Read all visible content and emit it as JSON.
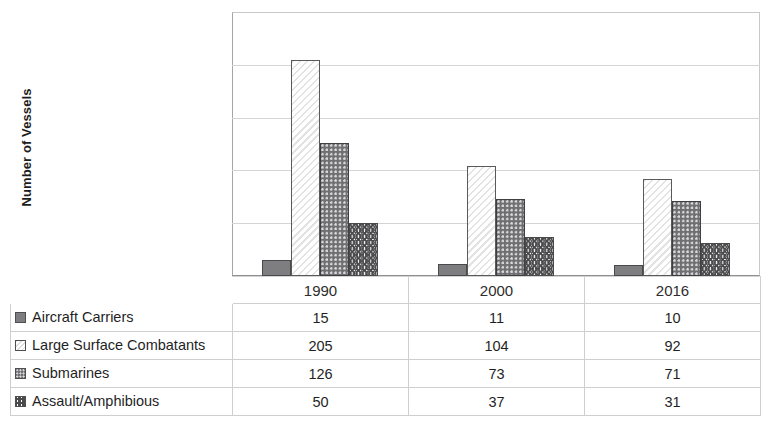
{
  "chart_data": {
    "type": "bar",
    "title": "",
    "xlabel": "",
    "ylabel": "Number of Vessels",
    "ylim": [
      0,
      250
    ],
    "yticks": [
      250,
      200,
      150,
      100,
      50,
      0
    ],
    "grid": true,
    "legend_position": "table-left-column",
    "categories": [
      "1990",
      "2000",
      "2016"
    ],
    "series": [
      {
        "name": "Aircraft Carriers",
        "pattern": "solid-gray",
        "values": [
          15,
          11,
          10
        ]
      },
      {
        "name": "Large Surface Combatants",
        "pattern": "light-diagonal-hatch",
        "values": [
          205,
          104,
          92
        ]
      },
      {
        "name": "Submarines",
        "pattern": "dark-dotted",
        "values": [
          126,
          73,
          71
        ]
      },
      {
        "name": "Assault/Amphibious",
        "pattern": "zigzag-wave",
        "values": [
          50,
          37,
          31
        ]
      }
    ]
  },
  "table": {
    "header": [
      "",
      "1990",
      "2000",
      "2016"
    ],
    "rows": [
      {
        "label": "Aircraft Carriers",
        "swatch": "solid-gray-swatch-icon",
        "values": [
          "15",
          "11",
          "10"
        ]
      },
      {
        "label": "Large Surface Combatants",
        "swatch": "hatch-swatch-icon",
        "values": [
          "205",
          "104",
          "92"
        ]
      },
      {
        "label": "Submarines",
        "swatch": "dotted-swatch-icon",
        "values": [
          "126",
          "73",
          "71"
        ]
      },
      {
        "label": "Assault/Amphibious",
        "swatch": "zigzag-swatch-icon",
        "values": [
          "50",
          "37",
          "31"
        ]
      }
    ]
  },
  "colors": {
    "solid_gray": "#7e7e80",
    "dotted_gray": "#6f6f72",
    "hatch_light": "#e3e3e3",
    "gridline": "#d4d4d4",
    "axis": "#8f8f8f",
    "text": "#2b2b2b"
  }
}
